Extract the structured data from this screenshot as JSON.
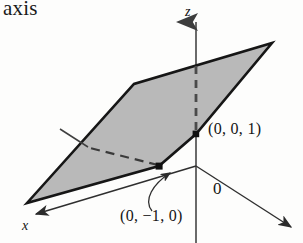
{
  "figure": {
    "caption_fragment": "axis",
    "axes": {
      "z_label": "z",
      "x_label": "x",
      "origin_label": "0"
    },
    "points": [
      {
        "name": "point-z-intercept",
        "label": "(0, 0, 1)",
        "px": 196,
        "py": 134
      },
      {
        "name": "point-y-intercept",
        "label": "(0, −1, 0)",
        "px": 159,
        "py": 166
      }
    ],
    "colors": {
      "plane_fill": "#b9b9b9",
      "plane_outline": "#161616",
      "axis_line": "#5b5b5b",
      "text": "#141414",
      "background": "#fdfdfc"
    },
    "geometry": {
      "plane_polygon": "27,203 134,84 272,43 196,134 159,166",
      "z_axis": "196,243 196,18",
      "z_axis_dashed": "196,70 196,134",
      "x_axis": "196,166 33,215",
      "y_axis": "196,166 293,228",
      "y_axis_negative_dashed": "159,166 84,146",
      "y_axis_negative_solid": "84,146 61,130",
      "leader_curve": "M 157,224 C 140,212 150,188 171,173"
    }
  }
}
